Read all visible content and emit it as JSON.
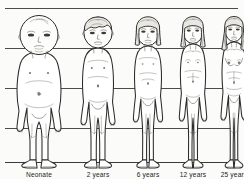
{
  "figure": {
    "background_color": "#fbfbfa",
    "line_color": "#2b2b29",
    "gridline_color": "#4a4a48"
  },
  "gridlines": {
    "count": 5,
    "y_positions": [
      8,
      48,
      88,
      128,
      162
    ],
    "description": "horizontal proportion reference lines"
  },
  "stages": [
    {
      "id": "neonate",
      "label": "Neonate",
      "head_fraction": "1/4",
      "order": 1
    },
    {
      "id": "age-2",
      "label": "2 years",
      "head_fraction": "1/5",
      "order": 2
    },
    {
      "id": "age-6",
      "label": "6 years",
      "head_fraction": "1/6",
      "order": 3
    },
    {
      "id": "age-12",
      "label": "12 years",
      "head_fraction": "1/7",
      "order": 4
    },
    {
      "id": "age-25",
      "label": "25 years",
      "head_fraction": "1/8",
      "order": 5
    }
  ]
}
